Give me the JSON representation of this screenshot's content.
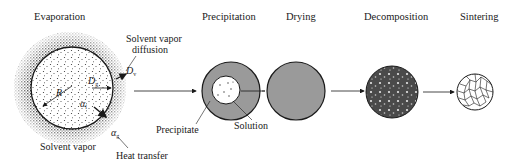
{
  "diagram": {
    "stages": [
      {
        "id": "evaporation",
        "label": "Evaporation"
      },
      {
        "id": "precipitation",
        "label": "Precipitation"
      },
      {
        "id": "drying",
        "label": "Drying"
      },
      {
        "id": "decomposition",
        "label": "Decomposition"
      },
      {
        "id": "sintering",
        "label": "Sintering"
      }
    ],
    "evaporation_annotations": {
      "solvent_vapor_diffusion_line1": "Solvent vapor",
      "solvent_vapor_diffusion_line2": "diffusion",
      "solvent_vapor": "Solvent vapor",
      "heat_transfer": "Heat transfer",
      "symbols": {
        "R": "R",
        "Dv": {
          "base": "D",
          "sub": "v"
        },
        "Dg": {
          "base": "D",
          "sub": "g"
        },
        "alpha_l": {
          "base": "α",
          "sub": "l"
        },
        "alpha_g": {
          "base": "α",
          "sub": "g"
        }
      }
    },
    "precipitation_annotations": {
      "precipitate": "Precipitate",
      "solution": "Solution"
    },
    "flow": [
      "evaporation",
      "precipitation",
      "drying",
      "decomposition",
      "sintering"
    ],
    "colors": {
      "shell_gray": "#9a9a9a",
      "decomposition_dark": "#4a4a4a",
      "outline": "#1a1a1a"
    }
  }
}
